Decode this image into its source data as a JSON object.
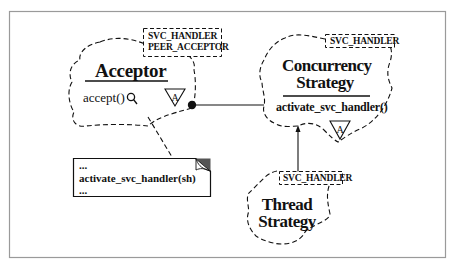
{
  "diagram": {
    "frame": {
      "x": 9,
      "y": 11,
      "width": 437,
      "height": 247,
      "border_color": "#9a9a9a"
    },
    "classes": [
      {
        "id": "acceptor",
        "name": "Acceptor",
        "template_params": [
          "SVC_HANDLER",
          "PEER_ACCEPTOR"
        ],
        "methods": [
          "accept()"
        ],
        "abstract_marker": "A",
        "method_icon": "magnifier-icon"
      },
      {
        "id": "concurrency-strategy",
        "name_lines": [
          "Concurrency",
          "Strategy"
        ],
        "template_params": [
          "SVC_HANDLER"
        ],
        "methods": [
          "activate_svc_handler()"
        ],
        "abstract_marker": "A"
      },
      {
        "id": "thread-strategy",
        "name_lines": [
          "Thread",
          "Strategy"
        ],
        "template_params": [
          "SVC_HANDLER"
        ]
      }
    ],
    "note": {
      "lines": [
        "...",
        "activate_svc_handler(sh)",
        "..."
      ]
    },
    "relationships": [
      {
        "type": "association-uses",
        "from": "acceptor",
        "to": "concurrency-strategy",
        "end_marker": "filled-circle"
      },
      {
        "type": "inheritance",
        "from": "thread-strategy",
        "to": "concurrency-strategy",
        "end_marker": "arrowhead"
      },
      {
        "type": "note-link",
        "from": "acceptor",
        "to": "note"
      }
    ],
    "colors": {
      "line": "#111111",
      "frame": "#9a9a9a",
      "note_corner": "#555555",
      "background": "#ffffff"
    }
  }
}
